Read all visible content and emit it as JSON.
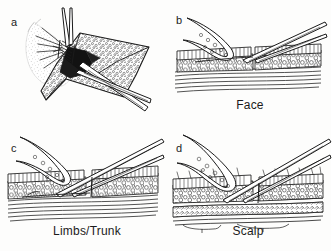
{
  "figure": {
    "type": "medical-line-illustration",
    "background_color": "#fdfdfc",
    "ink_color": "#1b1b1b",
    "panel_count": 4
  },
  "panels": [
    {
      "id": "a",
      "letter": "a",
      "caption": "",
      "view": "three-quarter-perspective",
      "description": "Skin flap elevated and retracted with forceps while scissors undermine beneath it; bleeding/spray shown at the wound edge",
      "instruments": [
        "forceps",
        "scissors"
      ]
    },
    {
      "id": "b",
      "letter": "b",
      "caption": "Face",
      "view": "cross-section",
      "description": "Cross-section of facial skin: flap reflected back, scissors dissecting in the subcutaneous fat just beneath the dermis",
      "instruments": [
        "scissors"
      ],
      "layers": [
        "epidermis",
        "dermis",
        "subcutaneous fat",
        "muscle"
      ]
    },
    {
      "id": "c",
      "letter": "c",
      "caption": "Limbs/Trunk",
      "view": "cross-section",
      "description": "Cross-section of limb/trunk skin: undermining carried deeper, at the base of the subcutaneous fat above the fascia",
      "instruments": [
        "scissors"
      ],
      "layers": [
        "epidermis",
        "dermis",
        "subcutaneous fat",
        "fascia",
        "muscle"
      ]
    },
    {
      "id": "d",
      "letter": "d",
      "caption": "Scalp",
      "view": "cross-section",
      "description": "Cross-section of scalp: undermining in the subgaleal plane below the galea aponeurotica, above periosteum",
      "instruments": [
        "scissors"
      ],
      "layers": [
        "epidermis",
        "dermis",
        "subcutaneous fat",
        "galea",
        "loose areolar tissue",
        "periosteum"
      ]
    }
  ]
}
